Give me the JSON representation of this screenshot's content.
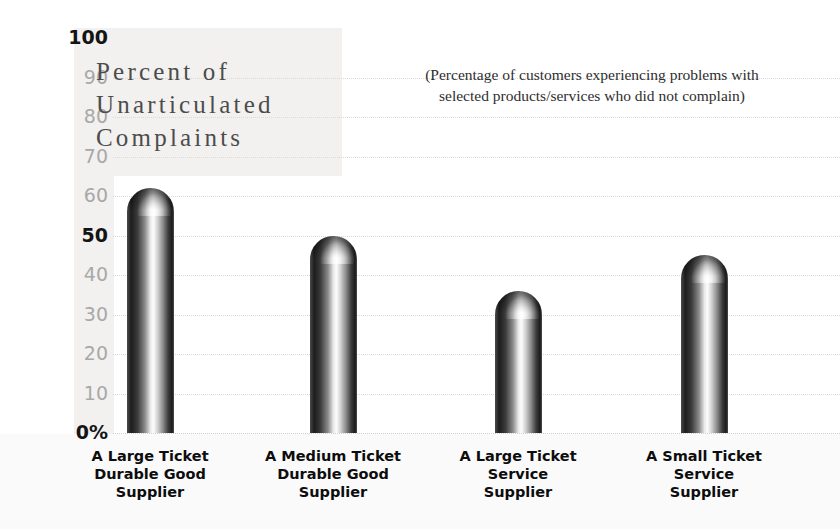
{
  "chart_data": {
    "type": "bar",
    "title": "Percent of Unarticulated Complaints",
    "title_lines": [
      "Percent of",
      "Unarticulated",
      "Complaints"
    ],
    "subtitle": "(Percentage of customers experiencing problems with selected products/services who did not complain)",
    "subtitle_lines": [
      "(Percentage of customers experiencing problems with",
      "selected products/services who did not complain)"
    ],
    "xlabel": "",
    "ylabel": "",
    "ylim": [
      0,
      100
    ],
    "grid": true,
    "legend": "none",
    "yticks": [
      {
        "label": "100",
        "value": 100,
        "emphasis": "strong"
      },
      {
        "label": "90",
        "value": 90,
        "emphasis": "normal"
      },
      {
        "label": "80",
        "value": 80,
        "emphasis": "normal"
      },
      {
        "label": "70",
        "value": 70,
        "emphasis": "normal"
      },
      {
        "label": "60",
        "value": 60,
        "emphasis": "normal"
      },
      {
        "label": "50",
        "value": 50,
        "emphasis": "strong"
      },
      {
        "label": "40",
        "value": 40,
        "emphasis": "normal"
      },
      {
        "label": "30",
        "value": 30,
        "emphasis": "normal"
      },
      {
        "label": "20",
        "value": 20,
        "emphasis": "normal"
      },
      {
        "label": "10",
        "value": 10,
        "emphasis": "normal"
      },
      {
        "label": "0%",
        "value": 0,
        "emphasis": "strong"
      }
    ],
    "categories": [
      "A Large Ticket Durable Good Supplier",
      "A Medium Ticket Durable Good Supplier",
      "A Large Ticket Service Supplier",
      "A Small Ticket Service Supplier"
    ],
    "category_lines": [
      [
        "A Large Ticket",
        "Durable Good",
        "Supplier"
      ],
      [
        "A Medium Ticket",
        "Durable Good",
        "Supplier"
      ],
      [
        "A Large Ticket",
        "Service",
        "Supplier"
      ],
      [
        "A Small Ticket",
        "Service",
        "Supplier"
      ]
    ],
    "values": [
      62,
      50,
      36,
      45
    ],
    "colors": {
      "bar_dark": "#1a1a1a",
      "bar_highlight": "#fdfdfd",
      "gridline": "#d9d9d9",
      "tick_muted": "#a8a8a8",
      "tick_strong": "#141414",
      "title_text": "#4c4c4c",
      "subtitle_text": "#2e2e2e",
      "panel_tint": "#f2f1ef",
      "background": "#ffffff"
    }
  }
}
